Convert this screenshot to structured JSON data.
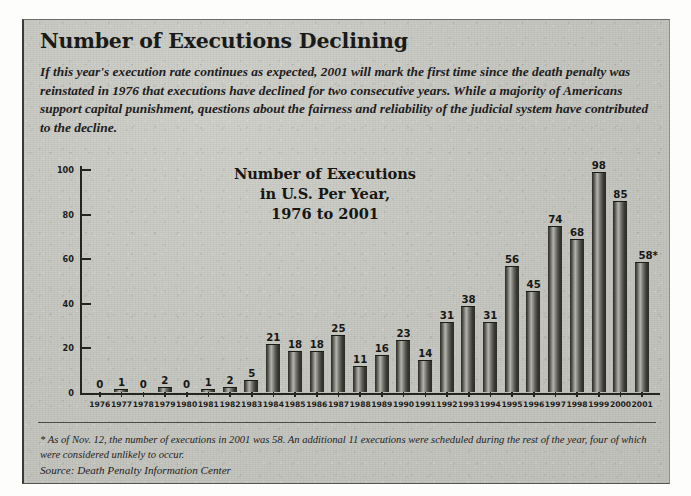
{
  "headline": "Number of Executions Declining",
  "deck": "If this year's execution rate continues as expected, 2001 will mark the first time since the death penalty was reinstated in 1976 that executions have declined for two consecutive years. While a majority of Americans support capital punishment, questions about the fairness and reliability of the judicial system have contributed to the decline.",
  "footnote": "* As of Nov. 12, the number of executions in 2001 was 58. An additional 11 executions were scheduled during the rest of the year, four of which were considered unlikely to occur.",
  "source": "Source: Death Penalty Information Center",
  "chart_data": {
    "type": "bar",
    "title": "Number of Executions\nin U.S. Per Year,\n1976 to 2001",
    "title_lines": [
      "Number of Executions",
      "in U.S. Per Year,",
      "1976 to 2001"
    ],
    "xlabel": "",
    "ylabel": "",
    "ylim": [
      0,
      100
    ],
    "yticks": [
      0,
      20,
      40,
      60,
      80,
      100
    ],
    "grid": false,
    "legend": false,
    "categories": [
      "1976",
      "1977",
      "1978",
      "1979",
      "1980",
      "1981",
      "1982",
      "1983",
      "1984",
      "1985",
      "1986",
      "1987",
      "1988",
      "1989",
      "1990",
      "1991",
      "1992",
      "1993",
      "1994",
      "1995",
      "1996",
      "1997",
      "1998",
      "1999",
      "2000",
      "2001"
    ],
    "values": [
      0,
      1,
      0,
      2,
      0,
      1,
      2,
      5,
      21,
      18,
      18,
      25,
      11,
      16,
      23,
      14,
      31,
      38,
      31,
      56,
      45,
      74,
      68,
      98,
      85,
      58
    ],
    "value_labels": [
      "0",
      "1",
      "0",
      "2",
      "0",
      "1",
      "2",
      "5",
      "21",
      "18",
      "18",
      "25",
      "11",
      "16",
      "23",
      "14",
      "31",
      "38",
      "31",
      "56",
      "45",
      "74",
      "68",
      "98",
      "85",
      "58*"
    ],
    "annotations": [
      "58* — asterisk denotes partial-year figure as of Nov. 12, 2001"
    ]
  },
  "colors": {
    "paper": "#c6c6c0",
    "ink": "#1a1a18",
    "bar_dark": "#2a2a26",
    "bar_light": "#b4b4ac",
    "axis": "#25251f"
  }
}
